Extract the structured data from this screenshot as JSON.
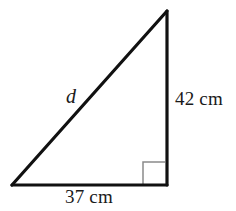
{
  "figure": {
    "type": "right-triangle-diagram",
    "background_color": "#ffffff",
    "stroke_color": "#111111",
    "stroke_width": 3,
    "right_angle_marker": {
      "name": "right-angle-marker",
      "color": "#8a8a8a",
      "size": 22,
      "present": true
    },
    "vertices": {
      "apex": {
        "x": 167,
        "y": 11
      },
      "bottom_left": {
        "x": 12,
        "y": 185
      },
      "bottom_right": {
        "x": 167,
        "y": 185
      }
    },
    "sides": {
      "hypotenuse": {
        "name": "hypotenuse",
        "label": "d",
        "from": "bottom_left",
        "to": "apex"
      },
      "vertical": {
        "name": "vertical-leg",
        "label": "42 cm",
        "value": 42,
        "unit": "cm",
        "from": "apex",
        "to": "bottom_right"
      },
      "base": {
        "name": "base-leg",
        "label": "37 cm",
        "value": 37,
        "unit": "cm",
        "from": "bottom_left",
        "to": "bottom_right"
      }
    }
  }
}
